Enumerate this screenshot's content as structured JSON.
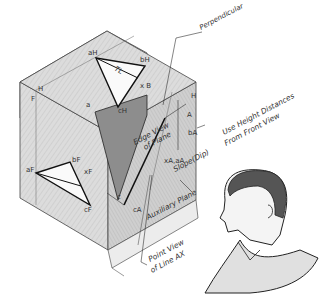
{
  "figure": {
    "colors": {
      "box_fill": "#d9d9d9",
      "box_shade": "#c4c4c4",
      "plane_dark": "#8a8a8a",
      "line": "#222222"
    }
  },
  "labels": {
    "perpendicular": "Perpendicular",
    "edge_view_1": "Edge View",
    "edge_view_2": "of Plane",
    "height_1": "Use Height Distances",
    "height_2": "From Front View",
    "slope": "Slope(Dip)",
    "auxiliary_plane": "Auxiliary Plane",
    "point_view_1": "Point View",
    "point_view_2": "of Line AX",
    "TL": "TL"
  },
  "points": {
    "a_top": "aH",
    "b_top": "bH",
    "x_b": "x B",
    "a": "a",
    "c_top": "cH",
    "H_left": "H",
    "F_left": "F",
    "a_front": "aF",
    "b_front": "bF",
    "x_front": "xF",
    "c_front": "cF",
    "c_mid": "c",
    "c_aux": "cA",
    "b_aux": "bA",
    "a_aux": "xA",
    "A_right": "A",
    "H_right": "H",
    "x_a_aux": "xA,aA"
  }
}
